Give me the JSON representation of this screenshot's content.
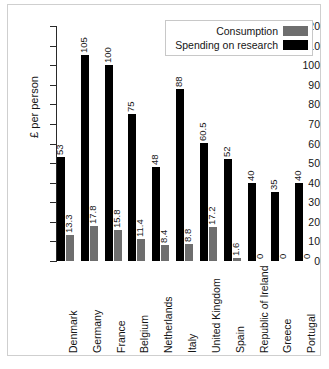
{
  "chart_data": {
    "type": "bar",
    "title": "",
    "xlabel": "",
    "ylabel": "£ per person",
    "ylim": [
      0,
      120
    ],
    "yticks": [
      0,
      10,
      20,
      30,
      40,
      50,
      60,
      70,
      80,
      90,
      100,
      110,
      120
    ],
    "grid": false,
    "legend_position": "top-right",
    "categories": [
      "Denmark",
      "Germany",
      "France",
      "Belgium",
      "Netherlands",
      "Italy",
      "United Kingdom",
      "Spain",
      "Republic of Ireland",
      "Greece",
      "Portugal"
    ],
    "series": [
      {
        "name": "Spending on research",
        "color": "#000000",
        "values": [
          53,
          105,
          100,
          75,
          48,
          88,
          60.5,
          52,
          40,
          35,
          40
        ],
        "labels": [
          "53",
          "105",
          "100",
          "75",
          "48",
          "88",
          "60.5",
          "52",
          "40",
          "35",
          "40"
        ]
      },
      {
        "name": "Consumption",
        "color": "#6e6e6e",
        "values": [
          13.3,
          17.8,
          15.8,
          11.4,
          8.4,
          8.8,
          17.2,
          1.6,
          0,
          0,
          0
        ],
        "labels": [
          "13.3",
          "17.8",
          "15.8",
          "11.4",
          "8.4",
          "8.8",
          "17.2",
          "1.6",
          "0",
          "0",
          "0"
        ]
      }
    ]
  },
  "legend": {
    "entries": [
      {
        "label": "Consumption",
        "swatch": "consumption"
      },
      {
        "label": "Spending on research",
        "swatch": "research"
      }
    ]
  }
}
